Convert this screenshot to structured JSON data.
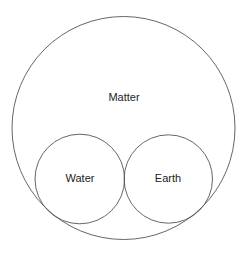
{
  "diagram": {
    "type": "nested-circles",
    "outer": {
      "label": "Matter",
      "cx": 123.5,
      "cy": 128,
      "r": 111.5,
      "label_x": 124,
      "label_y": 101
    },
    "inner": [
      {
        "label": "Water",
        "cx": 79.8,
        "cy": 179,
        "r": 44.8,
        "label_x": 80,
        "label_y": 182
      },
      {
        "label": "Earth",
        "cx": 168.3,
        "cy": 179,
        "r": 44.2,
        "label_x": 168,
        "label_y": 182
      }
    ],
    "colors": {
      "stroke": "#555555",
      "text": "#222222",
      "background": "#ffffff"
    }
  }
}
